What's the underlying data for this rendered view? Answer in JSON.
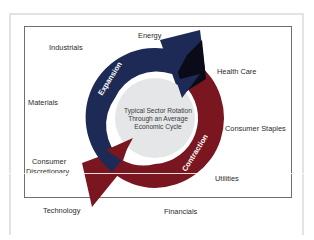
{
  "diagram": {
    "title": "Typical Sector Rotation Through an Average Economic Cycle",
    "center_text_lines": [
      "Typical Sector Rotation",
      "Through an Average",
      "Economic Cycle"
    ],
    "phases": [
      {
        "label": "Expansion",
        "color": "#1c2a55"
      },
      {
        "label": "Contraction",
        "color": "#7a1620"
      }
    ],
    "sectors": {
      "energy": "Energy",
      "industrials": "Industrials",
      "health_care": "Health Care",
      "materials": "Materials",
      "consumer_staples": "Consumer Staples",
      "consumer_discretionary_line1": "Consumer",
      "consumer_discretionary_line2": "Discretionary",
      "utilities": "Utilities",
      "technology": "Technology",
      "financials": "Financials"
    },
    "colors": {
      "expansion": "#1c2a55",
      "contraction": "#7a1620",
      "overlap": "#0a0a18",
      "center_disc": "#e4e6e8",
      "frame": "#6e6e6e"
    }
  }
}
